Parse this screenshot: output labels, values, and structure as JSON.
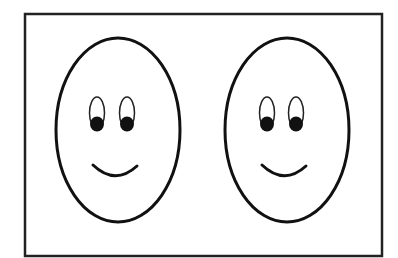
{
  "figure": {
    "colors": {
      "background": "#ffffff",
      "stroke": "#111111"
    },
    "faces": [
      {
        "id": "left-face",
        "cx": 118,
        "cy": 130,
        "rx": 63,
        "ry": 93
      },
      {
        "id": "right-face",
        "cx": 287,
        "cy": 130,
        "rx": 63,
        "ry": 93
      }
    ]
  }
}
